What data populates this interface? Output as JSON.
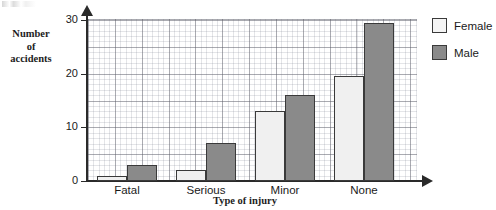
{
  "chart_data": {
    "type": "bar",
    "title": "",
    "xlabel": "Type of injury",
    "ylabel": "Number of accidents",
    "ylabel_lines": [
      "Number",
      "of",
      "accidents"
    ],
    "categories": [
      "Fatal",
      "Serious",
      "Minor",
      "None"
    ],
    "series": [
      {
        "name": "Female",
        "color": "#f0f0f0",
        "values": [
          1,
          2,
          13,
          19.5
        ]
      },
      {
        "name": "Male",
        "color": "#8a8a8a",
        "values": [
          3,
          7,
          16,
          29.5
        ]
      }
    ],
    "ylim": [
      0,
      30
    ],
    "yticks": [
      0,
      10,
      20,
      30
    ],
    "ytick_labels": [
      "0",
      "10",
      "20",
      "30"
    ],
    "grid": true,
    "grid_style": "graph-paper minor and major lines",
    "legend_position": "top-right",
    "axis_arrows": true
  },
  "legend": {
    "items": [
      {
        "label": "Female",
        "swatch": "female"
      },
      {
        "label": "Male",
        "swatch": "male"
      }
    ]
  },
  "axes": {
    "y_title_lines": [
      "Number",
      "of",
      "accidents"
    ],
    "x_title": "Type of injury"
  }
}
